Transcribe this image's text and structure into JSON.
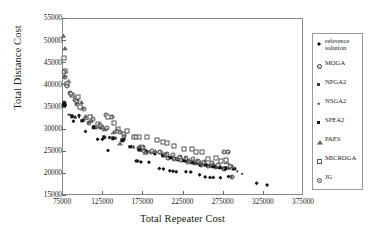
{
  "chart_data": {
    "type": "scatter",
    "title": "",
    "xlabel": "Total Repeater Cost",
    "ylabel": "Total Distance Cost",
    "xlim": [
      75000,
      375000
    ],
    "ylim": [
      15000,
      55000
    ],
    "xticks": [
      "75000",
      "125000",
      "175000",
      "225000",
      "275000",
      "325000",
      "375000"
    ],
    "yticks": [
      "15000",
      "20000",
      "25000",
      "30000",
      "35000",
      "40000",
      "45000",
      "50000",
      "55000"
    ],
    "grid": false,
    "legend_position": "right-outside",
    "series": [
      {
        "name": "reference solution",
        "marker": "filled-diamond",
        "color": "#111111",
        "points": [
          [
            76000,
            35600
          ],
          [
            76500,
            35400
          ],
          [
            77000,
            36000
          ],
          [
            78000,
            35500
          ],
          [
            88000,
            31900
          ],
          [
            90000,
            32800
          ],
          [
            95000,
            33200
          ],
          [
            103000,
            29600
          ],
          [
            110000,
            33100
          ],
          [
            118000,
            27800
          ],
          [
            124000,
            27800
          ],
          [
            131000,
            25300
          ],
          [
            133000,
            28200
          ],
          [
            166000,
            22900
          ],
          [
            168000,
            22900
          ],
          [
            172000,
            22700
          ],
          [
            182000,
            22600
          ],
          [
            195000,
            21200
          ],
          [
            200000,
            21100
          ],
          [
            208000,
            20700
          ],
          [
            212000,
            20600
          ],
          [
            216000,
            20500
          ],
          [
            228000,
            20500
          ],
          [
            234000,
            20400
          ],
          [
            245000,
            19800
          ],
          [
            252000,
            19300
          ],
          [
            258000,
            19200
          ],
          [
            262000,
            19200
          ],
          [
            271000,
            19100
          ],
          [
            281000,
            19400
          ],
          [
            316000,
            17900
          ],
          [
            329000,
            17500
          ]
        ]
      },
      {
        "name": "MOGA",
        "marker": "circle-dot",
        "color": "#333333",
        "points": [
          [
            77000,
            42000
          ],
          [
            79000,
            40300
          ],
          [
            84000,
            38300
          ],
          [
            90000,
            36800
          ],
          [
            92000,
            35800
          ],
          [
            97000,
            34800
          ],
          [
            104000,
            32700
          ],
          [
            107000,
            31600
          ],
          [
            116000,
            30600
          ],
          [
            124000,
            30700
          ],
          [
            129000,
            33300
          ],
          [
            136000,
            32900
          ],
          [
            146000,
            29500
          ],
          [
            151000,
            28500
          ],
          [
            163000,
            28300
          ],
          [
            170000,
            25900
          ],
          [
            176000,
            25200
          ],
          [
            184000,
            24900
          ],
          [
            196000,
            25000
          ],
          [
            201000,
            24300
          ],
          [
            206000,
            23700
          ],
          [
            213000,
            23300
          ],
          [
            222000,
            23100
          ],
          [
            231000,
            22700
          ],
          [
            239000,
            22400
          ],
          [
            247000,
            22100
          ],
          [
            255000,
            21800
          ],
          [
            266000,
            21500
          ],
          [
            276000,
            21000
          ],
          [
            281000,
            24900
          ],
          [
            285000,
            19400
          ]
        ]
      },
      {
        "name": "NPGA2",
        "marker": "small-square",
        "color": "#3a3a3a",
        "points": [
          [
            76500,
            36200
          ],
          [
            83000,
            33400
          ],
          [
            89000,
            32900
          ],
          [
            100000,
            32200
          ],
          [
            112000,
            30500
          ],
          [
            122000,
            30300
          ],
          [
            133000,
            28200
          ],
          [
            140000,
            28100
          ],
          [
            152000,
            27900
          ],
          [
            163000,
            26000
          ],
          [
            171000,
            25300
          ],
          [
            178000,
            25300
          ],
          [
            187000,
            25000
          ],
          [
            195000,
            24800
          ],
          [
            204000,
            24200
          ],
          [
            210000,
            23800
          ],
          [
            219000,
            23300
          ],
          [
            228000,
            22900
          ],
          [
            238000,
            22400
          ],
          [
            246000,
            22000
          ],
          [
            252000,
            21900
          ],
          [
            259000,
            21700
          ],
          [
            268000,
            21400
          ],
          [
            274000,
            21300
          ],
          [
            282000,
            21300
          ],
          [
            287000,
            21200
          ]
        ]
      },
      {
        "name": "NSGA2",
        "marker": "star",
        "color": "#222222",
        "points": [
          [
            76500,
            35800
          ],
          [
            87000,
            33100
          ],
          [
            95000,
            32800
          ],
          [
            108000,
            31700
          ],
          [
            120000,
            30500
          ],
          [
            128000,
            28300
          ],
          [
            139000,
            28100
          ],
          [
            150000,
            27800
          ],
          [
            160000,
            26300
          ],
          [
            172000,
            25400
          ],
          [
            180000,
            25100
          ],
          [
            190000,
            24700
          ],
          [
            198000,
            24300
          ],
          [
            207000,
            23900
          ],
          [
            215000,
            23500
          ],
          [
            224000,
            23200
          ],
          [
            232000,
            22900
          ],
          [
            241000,
            22500
          ],
          [
            249000,
            22200
          ],
          [
            257000,
            21900
          ],
          [
            265000,
            21600
          ],
          [
            272000,
            21400
          ],
          [
            279000,
            21300
          ],
          [
            286000,
            21000
          ],
          [
            292000,
            20600
          ],
          [
            298000,
            20000
          ]
        ]
      },
      {
        "name": "SPEA2",
        "marker": "filled-square",
        "color": "#111111",
        "points": [
          [
            76200,
            35600
          ],
          [
            76800,
            35900
          ],
          [
            86000,
            33000
          ],
          [
            99000,
            32000
          ],
          [
            113000,
            30500
          ],
          [
            126000,
            28300
          ],
          [
            137000,
            28000
          ],
          [
            149000,
            27600
          ],
          [
            159000,
            26100
          ],
          [
            169000,
            25500
          ],
          [
            179000,
            25000
          ],
          [
            189000,
            24600
          ],
          [
            199000,
            24100
          ],
          [
            209000,
            23700
          ],
          [
            218000,
            23300
          ],
          [
            226000,
            23000
          ],
          [
            235000,
            22600
          ],
          [
            244000,
            22300
          ],
          [
            253000,
            22000
          ],
          [
            262000,
            21700
          ],
          [
            270000,
            21500
          ],
          [
            278000,
            21300
          ],
          [
            288000,
            21100
          ]
        ]
      },
      {
        "name": "PAES",
        "marker": "open-triangle",
        "color": "#666666",
        "points": [
          [
            75500,
            51200
          ],
          [
            77500,
            48400
          ],
          [
            78500,
            43300
          ],
          [
            82000,
            41000
          ],
          [
            88000,
            37800
          ],
          [
            91000,
            37300
          ],
          [
            98000,
            36200
          ],
          [
            103000,
            33000
          ],
          [
            110000,
            32000
          ],
          [
            119000,
            30800
          ],
          [
            127000,
            30100
          ],
          [
            138000,
            29400
          ],
          [
            146000,
            26900
          ],
          [
            171000,
            26300
          ],
          [
            178000,
            24800
          ],
          [
            190000,
            25100
          ],
          [
            203000,
            24600
          ],
          [
            218000,
            23600
          ],
          [
            232000,
            23100
          ],
          [
            246000,
            22600
          ],
          [
            259000,
            22300
          ],
          [
            271000,
            22800
          ],
          [
            279000,
            22700
          ],
          [
            286000,
            21700
          ]
        ]
      },
      {
        "name": "MICROGA",
        "marker": "open-square",
        "color": "#555555",
        "points": [
          [
            75800,
            46200
          ],
          [
            77200,
            43300
          ],
          [
            80000,
            40300
          ],
          [
            86000,
            37900
          ],
          [
            94000,
            37400
          ],
          [
            96000,
            35100
          ],
          [
            108000,
            32800
          ],
          [
            118000,
            31200
          ],
          [
            131000,
            32800
          ],
          [
            138000,
            31400
          ],
          [
            143000,
            30100
          ],
          [
            155000,
            29600
          ],
          [
            163000,
            28300
          ],
          [
            170000,
            28400
          ],
          [
            180000,
            28300
          ],
          [
            192000,
            27600
          ],
          [
            199000,
            27200
          ],
          [
            205000,
            26900
          ],
          [
            213000,
            26400
          ],
          [
            226000,
            25600
          ],
          [
            235000,
            25700
          ],
          [
            241000,
            24900
          ],
          [
            248000,
            25000
          ],
          [
            256000,
            23400
          ],
          [
            266000,
            23500
          ],
          [
            272000,
            22900
          ],
          [
            278000,
            23200
          ]
        ]
      },
      {
        "name": "JG",
        "marker": "circle-dot-large",
        "color": "#444444",
        "points": [
          [
            76500,
            43000
          ],
          [
            80000,
            39900
          ],
          [
            85000,
            38000
          ],
          [
            93000,
            36500
          ],
          [
            101000,
            34700
          ],
          [
            112000,
            32400
          ],
          [
            121000,
            31100
          ],
          [
            130000,
            30300
          ],
          [
            142000,
            29800
          ],
          [
            151000,
            28900
          ],
          [
            166000,
            28300
          ],
          [
            175000,
            26100
          ],
          [
            186000,
            25100
          ],
          [
            196000,
            24900
          ],
          [
            204000,
            24600
          ],
          [
            212000,
            24200
          ],
          [
            221000,
            23900
          ],
          [
            228000,
            23600
          ],
          [
            237000,
            23300
          ],
          [
            243000,
            23000
          ],
          [
            251000,
            22700
          ],
          [
            261000,
            22400
          ],
          [
            268000,
            22000
          ],
          [
            275000,
            24900
          ],
          [
            283000,
            21800
          ]
        ]
      }
    ]
  },
  "legend": {
    "entries": [
      {
        "label": "reference\nsolution",
        "marker": "m-ref"
      },
      {
        "label": "MOGA",
        "marker": "m-moga"
      },
      {
        "label": "NPGA2",
        "marker": "m-npga"
      },
      {
        "label": "NSGA2",
        "marker": "m-nsga"
      },
      {
        "label": "SPEA2",
        "marker": "m-spea"
      },
      {
        "label": "PAES",
        "marker": "m-paes"
      },
      {
        "label": "MICROGA",
        "marker": "m-micro"
      },
      {
        "label": "JG",
        "marker": "m-jg"
      }
    ]
  }
}
